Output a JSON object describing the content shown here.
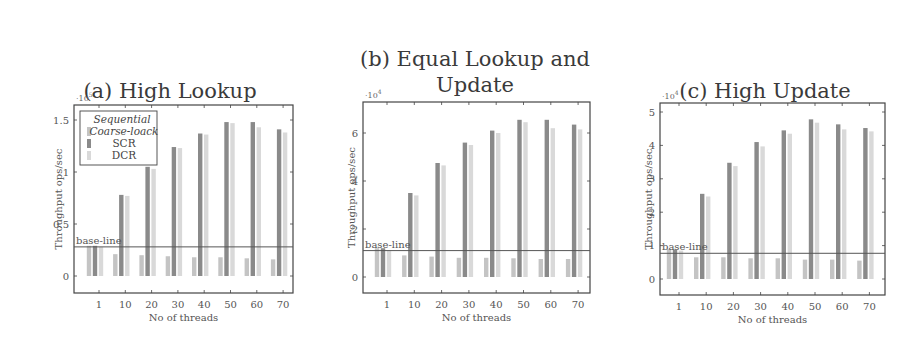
{
  "figure": {
    "panels": [
      {
        "id": "a",
        "title": "(a) High Lookup"
      },
      {
        "id": "b",
        "title_line1": "(b) Equal Lookup and",
        "title_line2": "Update"
      },
      {
        "id": "c",
        "title": "(c) High Update"
      }
    ],
    "legend": [
      "Sequential",
      "Coarse-loack",
      "SCR",
      "DCR"
    ],
    "baseline_label": "base-line",
    "xlabel": "No of threads",
    "ylabel": "Throughput ops/sec"
  },
  "colors": {
    "coarse": "#c4c4c4",
    "scr": "#8a8a8a",
    "dcr": "#d9d9d9",
    "baseline": "#555555",
    "frame": "#444444"
  },
  "chart_data": [
    {
      "type": "bar",
      "title": "(a) High Lookup",
      "xlabel": "No of threads",
      "ylabel": "Throughput ops/sec",
      "y_multiplier": "10^5",
      "categories": [
        "1",
        "10",
        "20",
        "30",
        "40",
        "50",
        "60",
        "70"
      ],
      "ylim": [
        -0.1,
        1.6
      ],
      "yticks": [
        0,
        0.5,
        1,
        1.5
      ],
      "baseline": {
        "label": "base-line",
        "value": 0.28
      },
      "legend_position": "upper left",
      "series": [
        {
          "name": "Coarse-loack",
          "values": [
            0.29,
            0.21,
            0.2,
            0.19,
            0.18,
            0.18,
            0.17,
            0.16
          ]
        },
        {
          "name": "SCR",
          "values": [
            0.29,
            0.78,
            1.05,
            1.24,
            1.37,
            1.48,
            1.48,
            1.41
          ]
        },
        {
          "name": "DCR",
          "values": [
            0.28,
            0.77,
            1.03,
            1.23,
            1.36,
            1.47,
            1.43,
            1.38
          ]
        }
      ]
    },
    {
      "type": "bar",
      "title": "(b) Equal Lookup and Update",
      "xlabel": "No of threads",
      "ylabel": "Throughput ops/sec",
      "y_multiplier": "10^4",
      "categories": [
        "1",
        "10",
        "20",
        "30",
        "40",
        "50",
        "60",
        "70"
      ],
      "ylim": [
        -0.6,
        7.2
      ],
      "yticks": [
        0,
        2,
        4,
        6
      ],
      "baseline": {
        "label": "base-line",
        "value": 1.1
      },
      "series": [
        {
          "name": "Coarse-loack",
          "values": [
            1.2,
            0.9,
            0.85,
            0.8,
            0.8,
            0.78,
            0.75,
            0.75
          ]
        },
        {
          "name": "SCR",
          "values": [
            1.2,
            3.5,
            4.75,
            5.6,
            6.1,
            6.55,
            6.55,
            6.35
          ]
        },
        {
          "name": "DCR",
          "values": [
            1.1,
            3.4,
            4.65,
            5.5,
            6.0,
            6.45,
            6.2,
            6.15
          ]
        }
      ]
    },
    {
      "type": "bar",
      "title": "(c) High Update",
      "xlabel": "No of threads",
      "ylabel": "Throughput ops/sec",
      "y_multiplier": "10^4",
      "categories": [
        "1",
        "10",
        "20",
        "30",
        "40",
        "50",
        "60",
        "70"
      ],
      "ylim": [
        -0.5,
        5.3
      ],
      "yticks": [
        0,
        1,
        2,
        3,
        4,
        5
      ],
      "baseline": {
        "label": "base-line",
        "value": 0.77
      },
      "series": [
        {
          "name": "Coarse-loack",
          "values": [
            0.9,
            0.65,
            0.65,
            0.62,
            0.62,
            0.58,
            0.58,
            0.55
          ]
        },
        {
          "name": "SCR",
          "values": [
            0.88,
            2.55,
            3.48,
            4.1,
            4.45,
            4.78,
            4.63,
            4.52
          ]
        },
        {
          "name": "DCR",
          "values": [
            0.85,
            2.47,
            3.38,
            3.97,
            4.35,
            4.68,
            4.48,
            4.42
          ]
        }
      ]
    }
  ]
}
